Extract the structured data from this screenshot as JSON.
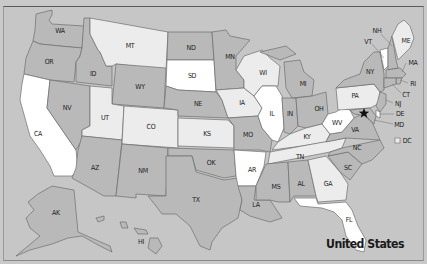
{
  "map": {
    "title": "United States",
    "capital_marker": "star-icon",
    "legend": {
      "dc_label": "DC"
    },
    "colors": {
      "background": "#c6c6c6",
      "white": "#ffffff",
      "light": "#ececec",
      "medium": "#d9d9d9",
      "dark": "#b9b9b9",
      "border": "#6e6e6e"
    },
    "states": [
      {
        "abbr": "WA",
        "shade": "dark"
      },
      {
        "abbr": "OR",
        "shade": "dark"
      },
      {
        "abbr": "CA",
        "shade": "white"
      },
      {
        "abbr": "ID",
        "shade": "dark"
      },
      {
        "abbr": "NV",
        "shade": "dark"
      },
      {
        "abbr": "MT",
        "shade": "light"
      },
      {
        "abbr": "WY",
        "shade": "dark"
      },
      {
        "abbr": "UT",
        "shade": "light"
      },
      {
        "abbr": "AZ",
        "shade": "dark"
      },
      {
        "abbr": "CO",
        "shade": "light"
      },
      {
        "abbr": "NM",
        "shade": "dark"
      },
      {
        "abbr": "ND",
        "shade": "dark"
      },
      {
        "abbr": "SD",
        "shade": "white"
      },
      {
        "abbr": "NE",
        "shade": "dark"
      },
      {
        "abbr": "KS",
        "shade": "light"
      },
      {
        "abbr": "OK",
        "shade": "dark"
      },
      {
        "abbr": "TX",
        "shade": "dark"
      },
      {
        "abbr": "MN",
        "shade": "dark"
      },
      {
        "abbr": "IA",
        "shade": "light"
      },
      {
        "abbr": "MO",
        "shade": "dark"
      },
      {
        "abbr": "AR",
        "shade": "white"
      },
      {
        "abbr": "LA",
        "shade": "dark"
      },
      {
        "abbr": "WI",
        "shade": "light"
      },
      {
        "abbr": "IL",
        "shade": "white"
      },
      {
        "abbr": "MI",
        "shade": "dark"
      },
      {
        "abbr": "IN",
        "shade": "dark"
      },
      {
        "abbr": "OH",
        "shade": "dark"
      },
      {
        "abbr": "KY",
        "shade": "light"
      },
      {
        "abbr": "TN",
        "shade": "light"
      },
      {
        "abbr": "MS",
        "shade": "dark"
      },
      {
        "abbr": "AL",
        "shade": "dark"
      },
      {
        "abbr": "GA",
        "shade": "light"
      },
      {
        "abbr": "FL",
        "shade": "white"
      },
      {
        "abbr": "SC",
        "shade": "dark"
      },
      {
        "abbr": "NC",
        "shade": "dark"
      },
      {
        "abbr": "VA",
        "shade": "dark"
      },
      {
        "abbr": "WV",
        "shade": "white"
      },
      {
        "abbr": "PA",
        "shade": "light"
      },
      {
        "abbr": "NY",
        "shade": "dark"
      },
      {
        "abbr": "VT",
        "shade": "white"
      },
      {
        "abbr": "NH",
        "shade": "dark"
      },
      {
        "abbr": "ME",
        "shade": "light"
      },
      {
        "abbr": "MA",
        "shade": "dark"
      },
      {
        "abbr": "RI",
        "shade": "dark"
      },
      {
        "abbr": "CT",
        "shade": "dark"
      },
      {
        "abbr": "NJ",
        "shade": "dark"
      },
      {
        "abbr": "DE",
        "shade": "white"
      },
      {
        "abbr": "MD",
        "shade": "dark"
      },
      {
        "abbr": "AK",
        "shade": "dark"
      },
      {
        "abbr": "HI",
        "shade": "dark"
      }
    ],
    "labels": {
      "WA": "WA",
      "OR": "OR",
      "CA": "CA",
      "ID": "ID",
      "NV": "NV",
      "MT": "MT",
      "WY": "WY",
      "UT": "UT",
      "AZ": "AZ",
      "CO": "CO",
      "NM": "NM",
      "ND": "ND",
      "SD": "SD",
      "NE": "NE",
      "KS": "KS",
      "OK": "OK",
      "TX": "TX",
      "MN": "MN",
      "IA": "IA",
      "MO": "MO",
      "AR": "AR",
      "LA": "LA",
      "WI": "WI",
      "IL": "IL",
      "MI": "MI",
      "IN": "IN",
      "OH": "OH",
      "KY": "KY",
      "TN": "TN",
      "MS": "MS",
      "AL": "AL",
      "GA": "GA",
      "FL": "FL",
      "SC": "SC",
      "NC": "NC",
      "VA": "VA",
      "WV": "WV",
      "PA": "PA",
      "NY": "NY",
      "VT": "VT",
      "NH": "NH",
      "ME": "ME",
      "MA": "MA",
      "RI": "RI",
      "CT": "CT",
      "NJ": "NJ",
      "DE": "DE",
      "MD": "MD",
      "DC": "DC",
      "AK": "AK",
      "HI": "HI"
    }
  }
}
